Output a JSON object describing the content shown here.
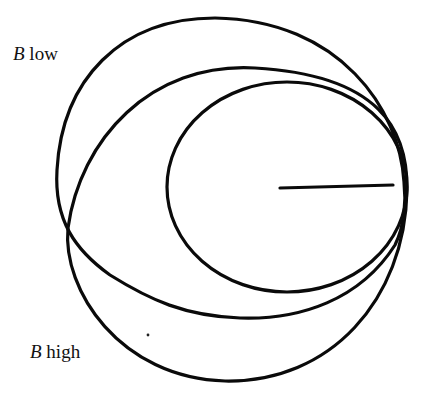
{
  "labels": {
    "b_low": {
      "variable": "B",
      "text": "low"
    },
    "b_high": {
      "variable": "B",
      "text": "high"
    }
  },
  "colors": {
    "stroke": "#0a0a0a",
    "background": "#ffffff",
    "text": "#111111"
  },
  "geometry": {
    "inner_circle": {
      "cx": 287,
      "cy": 187,
      "rx": 120,
      "ry": 105
    },
    "radius_line": {
      "x1": 280,
      "y1": 188,
      "x2": 393,
      "y2": 185
    },
    "b_low_ellipse": {
      "description": "largest upper ellipse, top at y~18, leftmost x~57"
    },
    "b_high_ellipse": {
      "description": "lower ellipse, bottom at y~381, leftmost x~66"
    },
    "mid_ellipse": {
      "description": "middle ellipse, top at y~68"
    }
  }
}
